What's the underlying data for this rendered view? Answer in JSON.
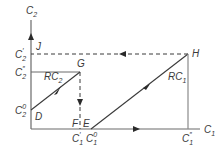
{
  "diagram": {
    "axes": {
      "y_label": "C",
      "y_label_sub": "2",
      "x_label": "C",
      "x_label_sub": "1"
    },
    "y_ticks": [
      {
        "base": "C",
        "sub": "2",
        "sup": "′",
        "y": 54
      },
      {
        "base": "C",
        "sub": "2",
        "sup": "″",
        "y": 72
      },
      {
        "base": "C",
        "sub": "2",
        "sup": "0",
        "y": 110
      }
    ],
    "x_ticks": [
      {
        "base": "C",
        "sub": "1",
        "sup": "′",
        "x": 80
      },
      {
        "base": "C",
        "sub": "1",
        "sup": "0",
        "x": 91
      },
      {
        "base": "C",
        "sub": "1",
        "sup": "″",
        "x": 188
      }
    ],
    "points": {
      "J": "J",
      "G": "G",
      "H": "H",
      "D": "D",
      "E": "E",
      "F": "F"
    },
    "curves": {
      "rc1": "RC",
      "rc1_sub": "1",
      "rc2": "RC",
      "rc2_sub": "2"
    },
    "colors": {
      "line": "#3a3a3a",
      "axis": "#6a6a6a"
    }
  }
}
